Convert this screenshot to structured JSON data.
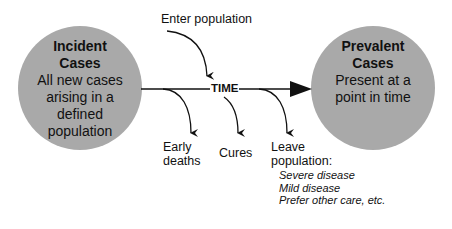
{
  "colors": {
    "circle_fill": "#a9a9a9",
    "line": "#111111",
    "background": "#ffffff"
  },
  "left_circle": {
    "title_line1": "Incident",
    "title_line2": "Cases",
    "body": [
      "All new cases",
      "arising in a",
      "defined",
      "population"
    ]
  },
  "right_circle": {
    "title_line1": "Prevalent",
    "title_line2": "Cases",
    "body": [
      "Present at a",
      "point in time"
    ]
  },
  "timeline": {
    "label": "TIME"
  },
  "inflow": {
    "label": "Enter population"
  },
  "outflows": [
    {
      "label_line1": "Early",
      "label_line2": "deaths"
    },
    {
      "label_line1": "Cures"
    },
    {
      "label_line1": "Leave",
      "label_line2": "population:"
    }
  ],
  "leave_reasons": [
    "Severe disease",
    "Mild disease",
    "Prefer other care, etc."
  ]
}
